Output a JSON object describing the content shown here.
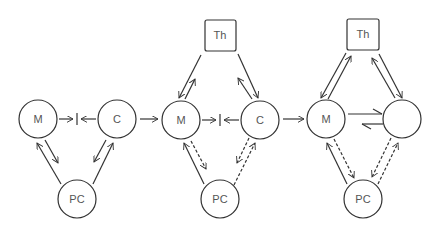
{
  "diagram": {
    "stroke_color": "#333333",
    "label_color": "#555555",
    "panels": [
      {
        "id": "panel-1",
        "nodes": [
          {
            "id": "m1",
            "label": "M",
            "shape": "circle"
          },
          {
            "id": "c1",
            "label": "C",
            "shape": "circle"
          },
          {
            "id": "pc1",
            "label": "PC",
            "shape": "circle"
          }
        ],
        "edges": [
          {
            "from": "m1",
            "to": "c1",
            "style": "blocked-arrows-meeting"
          },
          {
            "from": "pc1",
            "to": "m1",
            "style": "solid"
          },
          {
            "from": "m1",
            "to": "pc1",
            "style": "solid"
          },
          {
            "from": "pc1",
            "to": "c1",
            "style": "solid"
          },
          {
            "from": "c1",
            "to": "pc1",
            "style": "solid"
          }
        ]
      },
      {
        "id": "panel-2",
        "nodes": [
          {
            "id": "th2",
            "label": "Th",
            "shape": "square"
          },
          {
            "id": "m2",
            "label": "M",
            "shape": "circle"
          },
          {
            "id": "c2",
            "label": "C",
            "shape": "circle"
          },
          {
            "id": "pc2",
            "label": "PC",
            "shape": "circle"
          }
        ],
        "edges": [
          {
            "from": "th2",
            "to": "m2",
            "style": "solid"
          },
          {
            "from": "m2",
            "to": "th2",
            "style": "solid"
          },
          {
            "from": "th2",
            "to": "c2",
            "style": "solid"
          },
          {
            "from": "c2",
            "to": "th2",
            "style": "solid"
          },
          {
            "from": "m2",
            "to": "c2",
            "style": "blocked-arrows-meeting"
          },
          {
            "from": "pc2",
            "to": "m2",
            "style": "solid"
          },
          {
            "from": "m2",
            "to": "pc2",
            "style": "dashed"
          },
          {
            "from": "c2",
            "to": "pc2",
            "style": "dashed"
          },
          {
            "from": "pc2",
            "to": "c2",
            "style": "dashed"
          }
        ]
      },
      {
        "id": "panel-3",
        "nodes": [
          {
            "id": "th3",
            "label": "Th",
            "shape": "square"
          },
          {
            "id": "m3",
            "label": "M",
            "shape": "circle"
          },
          {
            "id": "x3",
            "label": "",
            "shape": "circle"
          },
          {
            "id": "pc3",
            "label": "PC",
            "shape": "circle"
          }
        ],
        "edges": [
          {
            "from": "th3",
            "to": "m3",
            "style": "solid"
          },
          {
            "from": "m3",
            "to": "th3",
            "style": "solid"
          },
          {
            "from": "th3",
            "to": "x3",
            "style": "solid"
          },
          {
            "from": "x3",
            "to": "th3",
            "style": "solid"
          },
          {
            "from": "m3",
            "to": "x3",
            "style": "harpoon"
          },
          {
            "from": "x3",
            "to": "m3",
            "style": "harpoon"
          },
          {
            "from": "pc3",
            "to": "m3",
            "style": "solid"
          },
          {
            "from": "m3",
            "to": "pc3",
            "style": "dashed"
          },
          {
            "from": "x3",
            "to": "pc3",
            "style": "dashed"
          },
          {
            "from": "pc3",
            "to": "x3",
            "style": "dashed"
          }
        ]
      }
    ],
    "transitions": [
      {
        "from": "panel-1",
        "to": "panel-2",
        "symbol": "arrow"
      },
      {
        "from": "panel-2",
        "to": "panel-3",
        "symbol": "arrow"
      }
    ]
  }
}
